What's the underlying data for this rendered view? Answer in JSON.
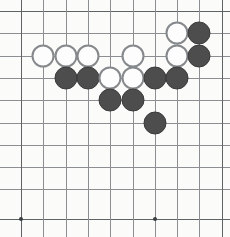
{
  "figure": {
    "kind": "go-board-diagram",
    "width": 230,
    "height": 237,
    "background_color": "#fbfbfa"
  },
  "board": {
    "columns": 10,
    "rows": 10,
    "cell_size": 22.3,
    "origin_x": 21,
    "origin_y": 11,
    "line_color": "#8b8f92",
    "strong_line_color": "#5d6265",
    "line_width": 1,
    "column_x": [
      21,
      43.3,
      65.6,
      87.9,
      110.2,
      132.5,
      154.8,
      177.1,
      199.4,
      221.7
    ],
    "row_y": [
      11,
      33.3,
      55.6,
      77.9,
      100.2,
      122.5,
      144.8,
      167.1,
      189.4,
      219
    ],
    "star_points": [
      {
        "name": "star-left-bottom",
        "col": 0,
        "row": 9,
        "x": 21,
        "y": 219
      },
      {
        "name": "star-center-bottom",
        "col": 6,
        "row": 9,
        "x": 154.8,
        "y": 219
      }
    ],
    "star_point_color": "#3b3f42",
    "star_point_size": 4
  },
  "stones": {
    "black_color": "#4d4d4d",
    "black_border_color": "#3a3a3a",
    "white_color": "#fdfdfd",
    "white_border_color": "#86898c",
    "diameter": 23,
    "black_count": 10,
    "white_count": 8,
    "total_count": 18,
    "items": [
      {
        "label": "W1",
        "color": "white",
        "col": 7,
        "row": 1,
        "x": 177.1,
        "y": 33.3
      },
      {
        "label": "B1",
        "color": "black",
        "col": 8,
        "row": 1,
        "x": 199.4,
        "y": 33.3
      },
      {
        "label": "W2",
        "color": "white",
        "col": 1,
        "row": 2,
        "x": 43.3,
        "y": 55.6
      },
      {
        "label": "W3",
        "color": "white",
        "col": 2,
        "row": 2,
        "x": 65.6,
        "y": 55.6
      },
      {
        "label": "W4",
        "color": "white",
        "col": 3,
        "row": 2,
        "x": 87.9,
        "y": 55.6
      },
      {
        "label": "W5",
        "color": "white",
        "col": 5,
        "row": 2,
        "x": 132.5,
        "y": 55.6
      },
      {
        "label": "W6",
        "color": "white",
        "col": 7,
        "row": 2,
        "x": 177.1,
        "y": 55.6
      },
      {
        "label": "B2",
        "color": "black",
        "col": 8,
        "row": 2,
        "x": 199.4,
        "y": 55.6
      },
      {
        "label": "B3",
        "color": "black",
        "col": 2,
        "row": 3,
        "x": 65.6,
        "y": 77.9
      },
      {
        "label": "B4",
        "color": "black",
        "col": 3,
        "row": 3,
        "x": 87.9,
        "y": 77.9
      },
      {
        "label": "W7",
        "color": "white",
        "col": 4,
        "row": 3,
        "x": 110.2,
        "y": 77.9
      },
      {
        "label": "W8",
        "color": "white",
        "col": 5,
        "row": 3,
        "x": 132.5,
        "y": 77.9
      },
      {
        "label": "B5",
        "color": "black",
        "col": 6,
        "row": 3,
        "x": 154.8,
        "y": 77.9
      },
      {
        "label": "B6",
        "color": "black",
        "col": 7,
        "row": 3,
        "x": 177.1,
        "y": 77.9
      },
      {
        "label": "B7",
        "color": "black",
        "col": 4,
        "row": 4,
        "x": 110.2,
        "y": 100.2
      },
      {
        "label": "B8",
        "color": "black",
        "col": 5,
        "row": 4,
        "x": 132.5,
        "y": 100.2
      },
      {
        "label": "B9",
        "color": "black",
        "col": 6,
        "row": 5,
        "x": 154.8,
        "y": 122.5
      }
    ]
  }
}
